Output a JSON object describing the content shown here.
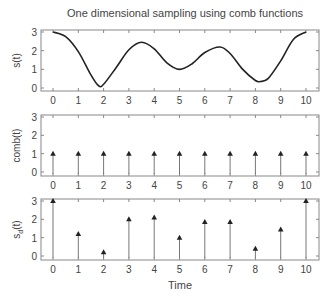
{
  "chart_data": [
    {
      "type": "line",
      "title": "One dimensional sampling using comb functions",
      "xlabel": "",
      "ylabel": "s(t)",
      "xlim": [
        0,
        10
      ],
      "ylim": [
        0,
        3
      ],
      "xticks": [
        0,
        1,
        2,
        3,
        4,
        5,
        6,
        7,
        8,
        9,
        10
      ],
      "yticks": [
        0,
        1,
        2,
        3
      ],
      "grid": false,
      "series": [
        {
          "name": "s(t)",
          "x": [
            0,
            0.5,
            1,
            1.5,
            1.8,
            2,
            2.5,
            3,
            3.5,
            4,
            4.5,
            5,
            5.5,
            6,
            6.6,
            7,
            7.5,
            8,
            8.2,
            8.5,
            9,
            9.5,
            10
          ],
          "values": [
            3,
            2.75,
            1.95,
            0.7,
            0.12,
            0.2,
            1.1,
            2.05,
            2.45,
            2.1,
            1.35,
            1.0,
            1.3,
            1.9,
            2.2,
            1.85,
            1.0,
            0.4,
            0.35,
            0.5,
            1.45,
            2.6,
            3
          ]
        }
      ]
    },
    {
      "type": "stem",
      "title": "",
      "xlabel": "",
      "ylabel": "comb(t)",
      "xlim": [
        0,
        10
      ],
      "ylim": [
        0,
        3
      ],
      "xticks": [
        0,
        1,
        2,
        3,
        4,
        5,
        6,
        7,
        8,
        9,
        10
      ],
      "yticks": [
        0,
        1,
        2,
        3
      ],
      "grid": false,
      "series": [
        {
          "name": "comb(t)",
          "x": [
            0,
            1,
            2,
            3,
            4,
            5,
            6,
            7,
            8,
            9,
            10
          ],
          "values": [
            1,
            1,
            1,
            1,
            1,
            1,
            1,
            1,
            1,
            1,
            1
          ]
        }
      ]
    },
    {
      "type": "stem",
      "title": "",
      "xlabel": "Time",
      "ylabel": "s_d(t)",
      "xlim": [
        0,
        10
      ],
      "ylim": [
        0,
        3
      ],
      "xticks": [
        0,
        1,
        2,
        3,
        4,
        5,
        6,
        7,
        8,
        9,
        10
      ],
      "yticks": [
        0,
        1,
        2,
        3
      ],
      "grid": false,
      "series": [
        {
          "name": "s_d(t)",
          "x": [
            0,
            1,
            2,
            3,
            4,
            5,
            6,
            7,
            8,
            9,
            10
          ],
          "values": [
            3,
            1.2,
            0.2,
            2.0,
            2.1,
            1.0,
            1.85,
            1.85,
            0.4,
            1.45,
            3
          ]
        }
      ]
    }
  ],
  "labels": {
    "title": "One dimensional sampling using comb functions",
    "panel1_ylabel": "s(t)",
    "panel2_ylabel": "comb(t)",
    "panel3_ylabel_main": "s",
    "panel3_ylabel_sub": "d",
    "panel3_ylabel_rest": "(t)",
    "xlabel": "Time"
  }
}
